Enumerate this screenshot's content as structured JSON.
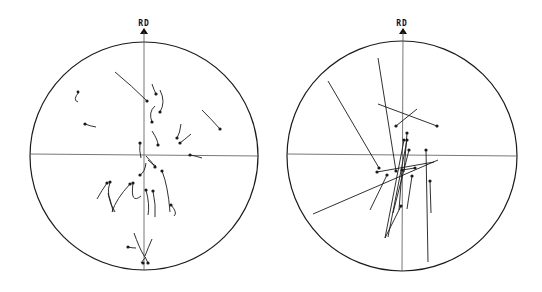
{
  "figure": {
    "panels": [
      {
        "id": "left",
        "axis_label": "RD",
        "circle": {
          "cx": 144,
          "cy": 156,
          "r": 114
        },
        "description": "Short curved trajectory arrows clustered near center"
      },
      {
        "id": "right",
        "axis_label": "RD",
        "circle": {
          "cx": 402,
          "cy": 156,
          "r": 115
        },
        "description": "Long straight trajectory lines converging near center"
      }
    ]
  },
  "colors": {
    "ink": "#1a1a1a",
    "axis": "#555555",
    "background": "#ffffff"
  }
}
